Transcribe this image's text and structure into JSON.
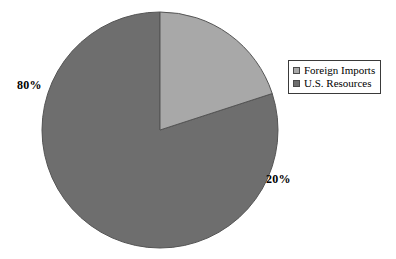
{
  "chart_data": {
    "type": "pie",
    "title": "",
    "categories": [
      "Foreign Imports",
      "U.S. Resources"
    ],
    "values": [
      20,
      80
    ],
    "unit": "%",
    "data_labels": [
      "20%",
      "80%"
    ],
    "colors": [
      "#a8a8a8",
      "#6e6e6e"
    ],
    "start_angle_deg": 0,
    "direction": "clockwise",
    "legend": {
      "position": "right",
      "entries": [
        {
          "label": "Foreign Imports",
          "color": "#a8a8a8"
        },
        {
          "label": "U.S. Resources",
          "color": "#6e6e6e"
        }
      ]
    },
    "grid": false,
    "background": "#ffffff"
  },
  "labels": {
    "left_percent": "80%",
    "right_percent": "20%"
  },
  "legend": {
    "items": [
      {
        "label": "Foreign Imports"
      },
      {
        "label": "U.S. Resources"
      }
    ]
  },
  "colors": {
    "slice_light": "#a8a8a8",
    "slice_dark": "#6e6e6e",
    "slice_outline": "#555555",
    "legend_border": "#3a3a3a",
    "text": "#000000",
    "background": "#ffffff"
  },
  "geometry": {
    "center_x": 160,
    "center_y": 130,
    "radius": 118
  }
}
